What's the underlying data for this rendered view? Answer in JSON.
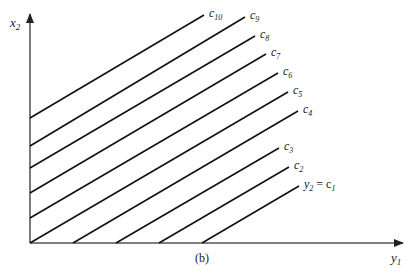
{
  "axes": {
    "x_label": "y",
    "x_label_sub": "1",
    "y_label": "x",
    "y_label_sub": "2"
  },
  "caption": "(b)",
  "lines": [
    {
      "id": "c1",
      "label": "y",
      "label_sub": "2",
      "label_eq": "= c",
      "label_eq_sub": "1",
      "x1": 202,
      "y1": 243,
      "x2": 299,
      "y2": 186
    },
    {
      "id": "c2",
      "label": "c",
      "label_sub": "2",
      "x1": 159,
      "y1": 243,
      "x2": 289,
      "y2": 167
    },
    {
      "id": "c3",
      "label": "c",
      "label_sub": "3",
      "x1": 116,
      "y1": 243,
      "x2": 279,
      "y2": 148
    },
    {
      "id": "c4",
      "label": "c",
      "label_sub": "4",
      "x1": 73,
      "y1": 243,
      "x2": 298,
      "y2": 111
    },
    {
      "id": "c5",
      "label": "c",
      "label_sub": "5",
      "x1": 30,
      "y1": 243,
      "x2": 288,
      "y2": 92
    },
    {
      "id": "c6",
      "label": "c",
      "label_sub": "6",
      "x1": 30,
      "y1": 218,
      "x2": 278,
      "y2": 73
    },
    {
      "id": "c7",
      "label": "c",
      "label_sub": "7",
      "x1": 30,
      "y1": 193,
      "x2": 266,
      "y2": 54
    },
    {
      "id": "c8",
      "label": "c",
      "label_sub": "8",
      "x1": 30,
      "y1": 168,
      "x2": 255,
      "y2": 36
    },
    {
      "id": "c9",
      "label": "c",
      "label_sub": "9",
      "x1": 30,
      "y1": 146,
      "x2": 245,
      "y2": 17
    },
    {
      "id": "c10",
      "label": "c",
      "label_sub": "10",
      "x1": 30,
      "y1": 118,
      "x2": 204,
      "y2": 15
    }
  ]
}
